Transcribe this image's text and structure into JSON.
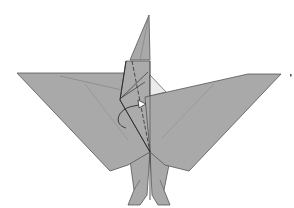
{
  "diagram": {
    "colors": {
      "paper": "#a9a9a9",
      "paper_light": "#b3b3b3",
      "inside": "#ececec",
      "line": "#555555",
      "dark_line": "#2e2e2e",
      "background": "#ffffff"
    },
    "annotations": {
      "arrow": "curved fold arrow",
      "dashed": "valley fold line",
      "marker": "small tick mark at right"
    }
  }
}
